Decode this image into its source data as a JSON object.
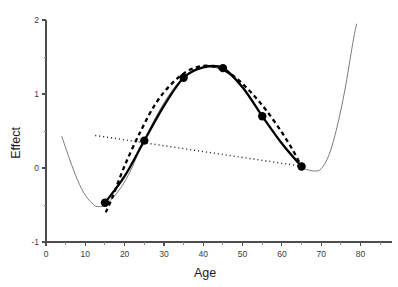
{
  "chart_data": {
    "type": "line",
    "title": "",
    "xlabel": "Age",
    "ylabel": "Effect",
    "xlim": [
      0,
      88
    ],
    "ylim": [
      -1,
      2
    ],
    "grid": false,
    "legend": "none",
    "x_ticks_major": [
      0,
      10,
      20,
      30,
      40,
      50,
      60,
      70,
      80
    ],
    "x_tick_labels": [
      "0",
      "10",
      "20",
      "30",
      "40",
      "50",
      "60",
      "70",
      "80"
    ],
    "x_ticks_minor": [
      5,
      15,
      25,
      35,
      45,
      55,
      65,
      75,
      85
    ],
    "y_ticks_major": [
      -1,
      0,
      1,
      2
    ],
    "y_tick_labels": [
      "-1",
      "0",
      "1",
      "2"
    ],
    "y_ticks_minor": [
      -0.5,
      0.5,
      1.5
    ],
    "series": [
      {
        "name": "spline-fit-thin",
        "style": "thin-solid",
        "color": "#6b6b6b",
        "x": [
          4,
          6,
          8,
          10,
          12,
          13,
          15,
          18,
          21,
          25,
          29,
          33,
          37,
          41,
          45,
          49,
          53,
          57,
          61,
          65,
          67,
          68.5,
          70,
          72,
          74,
          76,
          78,
          79
        ],
        "y": [
          0.43,
          0.12,
          -0.16,
          -0.37,
          -0.49,
          -0.52,
          -0.5,
          -0.34,
          -0.09,
          0.38,
          0.79,
          1.11,
          1.31,
          1.37,
          1.32,
          1.14,
          0.85,
          0.55,
          0.25,
          0.02,
          -0.03,
          -0.04,
          -0.01,
          0.18,
          0.55,
          1.05,
          1.68,
          1.95
        ]
      },
      {
        "name": "observed-solid",
        "style": "thick-solid",
        "color": "#000000",
        "x": [
          15,
          20,
          25,
          30,
          35,
          40,
          45,
          50,
          55,
          60,
          65
        ],
        "y": [
          -0.47,
          -0.11,
          0.37,
          0.84,
          1.22,
          1.36,
          1.35,
          1.09,
          0.7,
          0.33,
          0.02
        ]
      },
      {
        "name": "model-dashed",
        "style": "thick-dashed",
        "color": "#000000",
        "x": [
          15.2,
          17,
          20,
          24,
          28,
          32,
          36,
          40,
          44,
          48,
          52,
          56,
          60,
          63,
          65
        ],
        "y": [
          -0.6,
          -0.38,
          0.03,
          0.49,
          0.88,
          1.14,
          1.31,
          1.38,
          1.35,
          1.23,
          1.03,
          0.78,
          0.48,
          0.22,
          0.02
        ]
      },
      {
        "name": "linear-trend-dotted",
        "style": "thin-dotted",
        "color": "#2b2b2b",
        "x": [
          12.5,
          65.5
        ],
        "y": [
          0.44,
          0.02
        ]
      }
    ],
    "markers": {
      "shape": "filled-circle",
      "color": "#000000",
      "points": [
        {
          "x": 15,
          "y": -0.47
        },
        {
          "x": 25,
          "y": 0.37
        },
        {
          "x": 35,
          "y": 1.22
        },
        {
          "x": 45,
          "y": 1.35
        },
        {
          "x": 55,
          "y": 0.7
        },
        {
          "x": 65,
          "y": 0.02
        }
      ]
    }
  }
}
